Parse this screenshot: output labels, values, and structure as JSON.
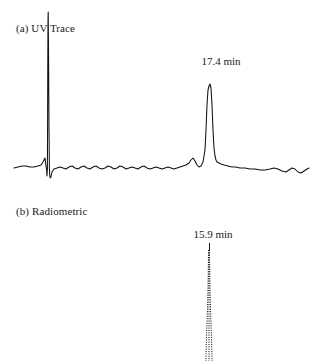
{
  "figure": {
    "background": "#ffffff",
    "ink_color": "#111111"
  },
  "panels": [
    {
      "id": "uv",
      "label": "(a) UV Trace",
      "peak_label": "17.4 min"
    },
    {
      "id": "radiometric",
      "label": "(b) Radiometric",
      "peak_label": "15.9 min"
    }
  ],
  "chart_data": [
    {
      "type": "line",
      "id": "uv-trace",
      "title": "(a) UV Trace",
      "xlabel": "",
      "ylabel": "",
      "grid": false,
      "legend": null,
      "annotations": [
        {
          "text": "17.4 min",
          "x": 220,
          "y": 62,
          "points_to_x": 220
        }
      ],
      "baseline_y": 168,
      "xlim": [
        14,
        310
      ],
      "ylim": [
        0,
        195
      ],
      "series": [
        {
          "name": "UV absorbance",
          "points": [
            [
              14,
              168
            ],
            [
              18,
              167
            ],
            [
              22,
              166
            ],
            [
              26,
              166
            ],
            [
              30,
              167
            ],
            [
              34,
              167
            ],
            [
              38,
              166
            ],
            [
              41,
              165
            ],
            [
              43,
              162
            ],
            [
              45,
              158
            ],
            [
              46,
              166
            ],
            [
              46.6,
              170
            ],
            [
              47,
              176
            ],
            [
              47.4,
              168
            ],
            [
              47.6,
              120
            ],
            [
              47.8,
              60
            ],
            [
              48,
              20
            ],
            [
              48.2,
              12
            ],
            [
              48.6,
              60
            ],
            [
              49,
              130
            ],
            [
              49.4,
              168
            ],
            [
              49.8,
              176
            ],
            [
              50.2,
              178
            ],
            [
              51,
              177
            ],
            [
              52,
              172
            ],
            [
              54,
              169
            ],
            [
              57,
              168
            ],
            [
              60,
              167
            ],
            [
              63,
              168
            ],
            [
              66,
              169
            ],
            [
              69,
              167
            ],
            [
              72,
              166
            ],
            [
              75,
              168
            ],
            [
              78,
              169
            ],
            [
              81,
              167
            ],
            [
              84,
              166
            ],
            [
              87,
              168
            ],
            [
              90,
              169
            ],
            [
              93,
              167
            ],
            [
              96,
              166
            ],
            [
              99,
              168
            ],
            [
              102,
              169
            ],
            [
              105,
              168
            ],
            [
              108,
              166
            ],
            [
              111,
              167
            ],
            [
              114,
              169
            ],
            [
              117,
              168
            ],
            [
              120,
              166
            ],
            [
              123,
              167
            ],
            [
              126,
              169
            ],
            [
              129,
              168
            ],
            [
              132,
              167
            ],
            [
              135,
              168
            ],
            [
              138,
              169
            ],
            [
              141,
              167
            ],
            [
              144,
              166
            ],
            [
              147,
              168
            ],
            [
              150,
              169
            ],
            [
              153,
              168
            ],
            [
              156,
              167
            ],
            [
              159,
              168
            ],
            [
              162,
              169
            ],
            [
              165,
              168
            ],
            [
              168,
              167
            ],
            [
              171,
              168
            ],
            [
              174,
              169
            ],
            [
              177,
              168
            ],
            [
              180,
              167
            ],
            [
              183,
              166
            ],
            [
              186,
              165
            ],
            [
              189,
              163
            ],
            [
              191,
              160
            ],
            [
              193,
              158
            ],
            [
              195,
              161
            ],
            [
              197,
              165
            ],
            [
              199,
              167
            ],
            [
              201,
              166
            ],
            [
              203,
              162
            ],
            [
              205,
              150
            ],
            [
              206,
              130
            ],
            [
              207,
              105
            ],
            [
              208,
              90
            ],
            [
              209,
              86
            ],
            [
              210,
              84
            ],
            [
              211,
              88
            ],
            [
              212,
              105
            ],
            [
              213,
              130
            ],
            [
              214,
              148
            ],
            [
              215,
              156
            ],
            [
              216,
              160
            ],
            [
              217,
              162
            ],
            [
              219,
              163
            ],
            [
              221,
              164
            ],
            [
              224,
              165
            ],
            [
              228,
              166
            ],
            [
              232,
              167
            ],
            [
              236,
              167
            ],
            [
              240,
              168
            ],
            [
              245,
              168
            ],
            [
              250,
              169
            ],
            [
              255,
              169
            ],
            [
              260,
              170
            ],
            [
              265,
              170
            ],
            [
              270,
              169
            ],
            [
              274,
              168
            ],
            [
              278,
              169
            ],
            [
              282,
              171
            ],
            [
              286,
              172
            ],
            [
              289,
              170
            ],
            [
              292,
              168
            ],
            [
              295,
              169
            ],
            [
              298,
              172
            ],
            [
              301,
              173
            ],
            [
              304,
              171
            ],
            [
              307,
              169
            ],
            [
              309,
              168
            ]
          ]
        }
      ]
    },
    {
      "type": "line",
      "id": "radiometric-trace",
      "title": "(b) Radiometric",
      "xlabel": "",
      "ylabel": "",
      "grid": false,
      "legend": null,
      "annotations": [
        {
          "text": "15.9 min",
          "x": 212,
          "y": 235,
          "points_to_x": 209
        }
      ],
      "style": "dotted",
      "xlim": [
        200,
        218
      ],
      "ylim": [
        248,
        361
      ],
      "series": [
        {
          "name": "Radiometric counts left edge",
          "points": [
            [
              208.6,
              250
            ],
            [
              208.4,
              262
            ],
            [
              208.2,
              275
            ],
            [
              208.0,
              288
            ],
            [
              207.7,
              300
            ],
            [
              207.4,
              312
            ],
            [
              207.0,
              324
            ],
            [
              206.6,
              336
            ],
            [
              206.2,
              348
            ],
            [
              205.9,
              361
            ]
          ]
        },
        {
          "name": "Radiometric counts right edge",
          "points": [
            [
              209.4,
              250
            ],
            [
              209.6,
              262
            ],
            [
              209.8,
              275
            ],
            [
              210.0,
              288
            ],
            [
              210.3,
              300
            ],
            [
              210.6,
              312
            ],
            [
              211.0,
              324
            ],
            [
              211.4,
              336
            ],
            [
              211.8,
              348
            ],
            [
              212.1,
              361
            ]
          ]
        },
        {
          "name": "Radiometric counts center",
          "points": [
            [
              209.0,
              250
            ],
            [
              209.0,
              268
            ],
            [
              209.0,
              286
            ],
            [
              209.0,
              304
            ],
            [
              209.0,
              322
            ],
            [
              209.0,
              340
            ],
            [
              209.0,
              361
            ]
          ]
        }
      ]
    }
  ]
}
